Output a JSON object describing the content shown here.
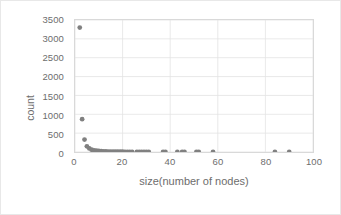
{
  "chart_data": {
    "type": "scatter",
    "title": "",
    "xlabel": "size(number of nodes)",
    "ylabel": "count",
    "xlim": [
      0,
      100
    ],
    "ylim": [
      0,
      3500
    ],
    "xticks": [
      0,
      20,
      40,
      60,
      80,
      100
    ],
    "yticks": [
      0,
      500,
      1000,
      1500,
      2000,
      2500,
      3000,
      3500
    ],
    "grid": true,
    "legend": false,
    "marker_color": "#808080",
    "series": [
      {
        "name": "component size distribution",
        "points": [
          [
            2,
            3300
          ],
          [
            3,
            870
          ],
          [
            4,
            330
          ],
          [
            5,
            150
          ],
          [
            6,
            95
          ],
          [
            7,
            62
          ],
          [
            8,
            45
          ],
          [
            9,
            34
          ],
          [
            10,
            27
          ],
          [
            11,
            22
          ],
          [
            12,
            18
          ],
          [
            13,
            15
          ],
          [
            14,
            13
          ],
          [
            15,
            11
          ],
          [
            16,
            10
          ],
          [
            17,
            9
          ],
          [
            18,
            8
          ],
          [
            19,
            7
          ],
          [
            20,
            7
          ],
          [
            21,
            6
          ],
          [
            22,
            5
          ],
          [
            23,
            5
          ],
          [
            24,
            4
          ],
          [
            26,
            4
          ],
          [
            27,
            3
          ],
          [
            28,
            3
          ],
          [
            29,
            3
          ],
          [
            30,
            2
          ],
          [
            31,
            2
          ],
          [
            37,
            2
          ],
          [
            38,
            2
          ],
          [
            43,
            2
          ],
          [
            45,
            1
          ],
          [
            46,
            1
          ],
          [
            51,
            1
          ],
          [
            52,
            1
          ],
          [
            58,
            1
          ],
          [
            84,
            1
          ],
          [
            90,
            1
          ]
        ]
      }
    ]
  },
  "axes": {
    "y_tick_labels": [
      "3500",
      "3000",
      "2500",
      "2000",
      "1500",
      "1000",
      "500",
      "0"
    ],
    "x_tick_labels": [
      "0",
      "20",
      "40",
      "60",
      "80",
      "100"
    ],
    "y_axis_title": "count",
    "x_axis_title": "size(number of nodes)"
  }
}
